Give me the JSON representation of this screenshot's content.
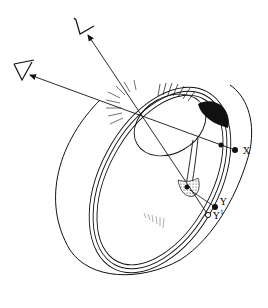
{
  "diagram": {
    "labels": {
      "x": "X",
      "y": "Y",
      "y1": "Y",
      "y1_sup": "1"
    },
    "points": {
      "x": {
        "cx": 235,
        "cy": 150,
        "filled": true
      },
      "y": {
        "cx": 215,
        "cy": 207,
        "filled": true
      },
      "y1": {
        "cx": 208,
        "cy": 215,
        "filled": false
      }
    },
    "viewers": [
      {
        "name": "viewer-upper",
        "x": 82,
        "y": 30
      },
      {
        "name": "viewer-left",
        "x": 20,
        "y": 72
      }
    ],
    "colors": {
      "ink": "#111111",
      "background": "#ffffff"
    }
  }
}
